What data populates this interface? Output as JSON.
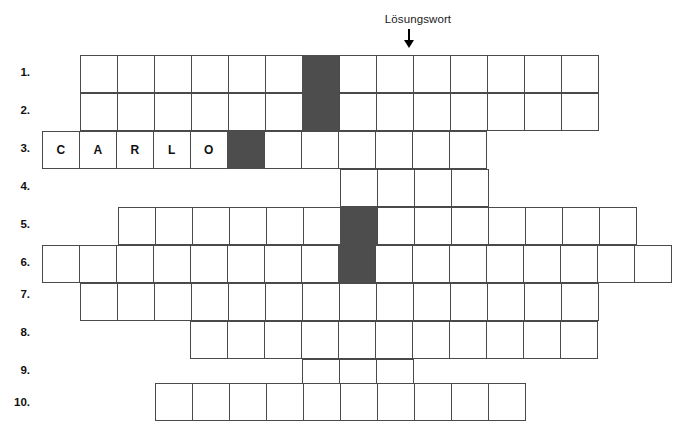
{
  "puzzle": {
    "type": "crossword-word-grid",
    "solution_label": "Lösungswort",
    "arrow_icon": "down-arrow-icon",
    "cell_size_px": 38,
    "grid_top_px": 55,
    "colors": {
      "shaded_cell": "#4d4d4d",
      "cell_border": "#4a4a4a",
      "background": "#ffffff",
      "text": "#101010"
    },
    "solution_column_index": 10,
    "row_labels": [
      "1.",
      "2.",
      "3.",
      "4.",
      "5.",
      "6.",
      "7.",
      "8.",
      "9.",
      "10."
    ],
    "rows": [
      {
        "label": "1.",
        "start_px": 80,
        "top_px": 55,
        "cells": [
          {
            "letter": "",
            "shaded": false
          },
          {
            "letter": "",
            "shaded": false
          },
          {
            "letter": "",
            "shaded": false
          },
          {
            "letter": "",
            "shaded": false
          },
          {
            "letter": "",
            "shaded": false
          },
          {
            "letter": "",
            "shaded": false
          },
          {
            "letter": "",
            "shaded": true
          },
          {
            "letter": "",
            "shaded": false
          },
          {
            "letter": "",
            "shaded": false
          },
          {
            "letter": "",
            "shaded": false
          },
          {
            "letter": "",
            "shaded": false
          },
          {
            "letter": "",
            "shaded": false
          },
          {
            "letter": "",
            "shaded": false
          },
          {
            "letter": "",
            "shaded": false
          }
        ]
      },
      {
        "label": "2.",
        "start_px": 80,
        "top_px": 93,
        "cells": [
          {
            "letter": "",
            "shaded": false
          },
          {
            "letter": "",
            "shaded": false
          },
          {
            "letter": "",
            "shaded": false
          },
          {
            "letter": "",
            "shaded": false
          },
          {
            "letter": "",
            "shaded": false
          },
          {
            "letter": "",
            "shaded": false
          },
          {
            "letter": "",
            "shaded": true
          },
          {
            "letter": "",
            "shaded": false
          },
          {
            "letter": "",
            "shaded": false
          },
          {
            "letter": "",
            "shaded": false
          },
          {
            "letter": "",
            "shaded": false
          },
          {
            "letter": "",
            "shaded": false
          },
          {
            "letter": "",
            "shaded": false
          },
          {
            "letter": "",
            "shaded": false
          }
        ]
      },
      {
        "label": "3.",
        "start_px": 42,
        "top_px": 131,
        "cells": [
          {
            "letter": "C",
            "shaded": false
          },
          {
            "letter": "A",
            "shaded": false
          },
          {
            "letter": "R",
            "shaded": false
          },
          {
            "letter": "L",
            "shaded": false
          },
          {
            "letter": "O",
            "shaded": false
          },
          {
            "letter": "",
            "shaded": true
          },
          {
            "letter": "",
            "shaded": false
          },
          {
            "letter": "",
            "shaded": false
          },
          {
            "letter": "",
            "shaded": false
          },
          {
            "letter": "",
            "shaded": false
          },
          {
            "letter": "",
            "shaded": false
          },
          {
            "letter": "",
            "shaded": false
          }
        ]
      },
      {
        "label": "4.",
        "start_px": 340,
        "top_px": 169,
        "cells": [
          {
            "letter": "",
            "shaded": false
          },
          {
            "letter": "",
            "shaded": false
          },
          {
            "letter": "",
            "shaded": false
          },
          {
            "letter": "",
            "shaded": false
          }
        ]
      },
      {
        "label": "5.",
        "start_px": 118,
        "top_px": 207,
        "cells": [
          {
            "letter": "",
            "shaded": false
          },
          {
            "letter": "",
            "shaded": false
          },
          {
            "letter": "",
            "shaded": false
          },
          {
            "letter": "",
            "shaded": false
          },
          {
            "letter": "",
            "shaded": false
          },
          {
            "letter": "",
            "shaded": false
          },
          {
            "letter": "",
            "shaded": true
          },
          {
            "letter": "",
            "shaded": false
          },
          {
            "letter": "",
            "shaded": false
          },
          {
            "letter": "",
            "shaded": false
          },
          {
            "letter": "",
            "shaded": false
          },
          {
            "letter": "",
            "shaded": false
          },
          {
            "letter": "",
            "shaded": false
          },
          {
            "letter": "",
            "shaded": false
          }
        ]
      },
      {
        "label": "6.",
        "start_px": 42,
        "top_px": 245,
        "cells": [
          {
            "letter": "",
            "shaded": false
          },
          {
            "letter": "",
            "shaded": false
          },
          {
            "letter": "",
            "shaded": false
          },
          {
            "letter": "",
            "shaded": false
          },
          {
            "letter": "",
            "shaded": false
          },
          {
            "letter": "",
            "shaded": false
          },
          {
            "letter": "",
            "shaded": false
          },
          {
            "letter": "",
            "shaded": false
          },
          {
            "letter": "",
            "shaded": true
          },
          {
            "letter": "",
            "shaded": false
          },
          {
            "letter": "",
            "shaded": false
          },
          {
            "letter": "",
            "shaded": false
          },
          {
            "letter": "",
            "shaded": false
          },
          {
            "letter": "",
            "shaded": false
          },
          {
            "letter": "",
            "shaded": false
          },
          {
            "letter": "",
            "shaded": false
          },
          {
            "letter": "",
            "shaded": false
          }
        ]
      },
      {
        "label": "7.",
        "start_px": 80,
        "top_px": 283,
        "cells": [
          {
            "letter": "",
            "shaded": false
          },
          {
            "letter": "",
            "shaded": false
          },
          {
            "letter": "",
            "shaded": false
          },
          {
            "letter": "",
            "shaded": false
          },
          {
            "letter": "",
            "shaded": false
          },
          {
            "letter": "",
            "shaded": false
          },
          {
            "letter": "",
            "shaded": false
          },
          {
            "letter": "",
            "shaded": false
          },
          {
            "letter": "",
            "shaded": false
          },
          {
            "letter": "",
            "shaded": false
          },
          {
            "letter": "",
            "shaded": false
          },
          {
            "letter": "",
            "shaded": false
          },
          {
            "letter": "",
            "shaded": false
          },
          {
            "letter": "",
            "shaded": false
          }
        ]
      },
      {
        "label": "8.",
        "start_px": 190,
        "top_px": 321,
        "cells": [
          {
            "letter": "",
            "shaded": false
          },
          {
            "letter": "",
            "shaded": false
          },
          {
            "letter": "",
            "shaded": false
          },
          {
            "letter": "",
            "shaded": false
          },
          {
            "letter": "",
            "shaded": false
          },
          {
            "letter": "",
            "shaded": false
          },
          {
            "letter": "",
            "shaded": false
          },
          {
            "letter": "",
            "shaded": false
          },
          {
            "letter": "",
            "shaded": false
          },
          {
            "letter": "",
            "shaded": false
          },
          {
            "letter": "",
            "shaded": false
          }
        ]
      },
      {
        "label": "9.",
        "start_px": 302,
        "top_px": 359,
        "cells": [
          {
            "letter": "",
            "shaded": false
          },
          {
            "letter": "",
            "shaded": false
          },
          {
            "letter": "",
            "shaded": false
          }
        ]
      },
      {
        "label": "10.",
        "start_px": 155,
        "top_px": 383,
        "cells": [
          {
            "letter": "",
            "shaded": false
          },
          {
            "letter": "",
            "shaded": false
          },
          {
            "letter": "",
            "shaded": false
          },
          {
            "letter": "",
            "shaded": false
          },
          {
            "letter": "",
            "shaded": false
          },
          {
            "letter": "",
            "shaded": false
          },
          {
            "letter": "",
            "shaded": false
          },
          {
            "letter": "",
            "shaded": false
          },
          {
            "letter": "",
            "shaded": false
          },
          {
            "letter": "",
            "shaded": false
          }
        ]
      }
    ],
    "label_positions_px": [
      {
        "label": "1.",
        "top": 66
      },
      {
        "label": "2.",
        "top": 104
      },
      {
        "label": "3.",
        "top": 142
      },
      {
        "label": "4.",
        "top": 180
      },
      {
        "label": "5.",
        "top": 218
      },
      {
        "label": "6.",
        "top": 256
      },
      {
        "label": "7.",
        "top": 288
      },
      {
        "label": "8.",
        "top": 326
      },
      {
        "label": "9.",
        "top": 364
      },
      {
        "label": "10.",
        "top": 396
      }
    ]
  }
}
